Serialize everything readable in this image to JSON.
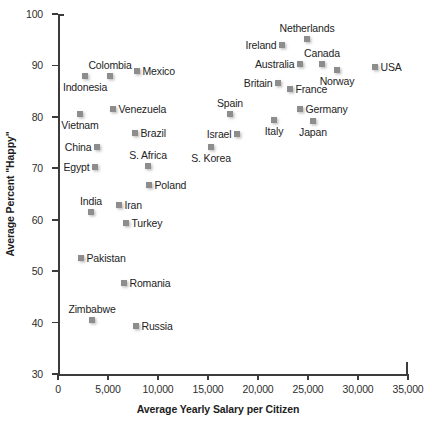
{
  "chart_data": {
    "type": "scatter",
    "title": "",
    "xlabel": "Average Yearly Salary per Citizen",
    "ylabel": "Average Percent \"Happy\"",
    "xlim": [
      0,
      35000
    ],
    "ylim": [
      30,
      100
    ],
    "xticks": [
      0,
      5000,
      10000,
      15000,
      20000,
      25000,
      30000,
      35000
    ],
    "xticklabels": [
      "0",
      "5,000",
      "10,000",
      "15,000",
      "20,000",
      "25,000",
      "30,000",
      "35,000"
    ],
    "yticks": [
      30,
      40,
      50,
      60,
      70,
      80,
      90,
      100
    ],
    "yticklabels": [
      "30",
      "40",
      "50",
      "60",
      "70",
      "80",
      "90",
      "100"
    ],
    "grid": false,
    "legend": null,
    "marker_color": "#8d8d8d",
    "marker_shape": "square",
    "points": [
      {
        "label": "Netherlands",
        "x": 24900,
        "y": 95.2,
        "label_pos": "above"
      },
      {
        "label": "Ireland",
        "x": 22400,
        "y": 94.0,
        "label_pos": "left"
      },
      {
        "label": "Canada",
        "x": 26400,
        "y": 90.2,
        "label_pos": "above"
      },
      {
        "label": "Australia",
        "x": 24200,
        "y": 90.2,
        "label_pos": "left"
      },
      {
        "label": "USA",
        "x": 31700,
        "y": 89.6,
        "label_pos": "right"
      },
      {
        "label": "Norway",
        "x": 27900,
        "y": 89.2,
        "label_pos": "below"
      },
      {
        "label": "Britain",
        "x": 22000,
        "y": 86.6,
        "label_pos": "left"
      },
      {
        "label": "France",
        "x": 23200,
        "y": 85.4,
        "label_pos": "right"
      },
      {
        "label": "Mexico",
        "x": 7900,
        "y": 88.9,
        "label_pos": "right"
      },
      {
        "label": "Colombia",
        "x": 5200,
        "y": 88.0,
        "label_pos": "above"
      },
      {
        "label": "Indonesia",
        "x": 2700,
        "y": 88.0,
        "label_pos": "below"
      },
      {
        "label": "Germany",
        "x": 24200,
        "y": 81.5,
        "label_pos": "right"
      },
      {
        "label": "Venezuela",
        "x": 5500,
        "y": 81.6,
        "label_pos": "right"
      },
      {
        "label": "Spain",
        "x": 17200,
        "y": 80.5,
        "label_pos": "above"
      },
      {
        "label": "Vietnam",
        "x": 2200,
        "y": 80.5,
        "label_pos": "below"
      },
      {
        "label": "Italy",
        "x": 21600,
        "y": 79.4,
        "label_pos": "below"
      },
      {
        "label": "Japan",
        "x": 25500,
        "y": 79.2,
        "label_pos": "below"
      },
      {
        "label": "Brazil",
        "x": 7700,
        "y": 76.9,
        "label_pos": "right"
      },
      {
        "label": "Israel",
        "x": 17900,
        "y": 76.7,
        "label_pos": "left"
      },
      {
        "label": "China",
        "x": 3900,
        "y": 74.2,
        "label_pos": "left"
      },
      {
        "label": "S. Korea",
        "x": 15300,
        "y": 74.2,
        "label_pos": "below"
      },
      {
        "label": "S. Africa",
        "x": 9000,
        "y": 70.5,
        "label_pos": "above"
      },
      {
        "label": "Egypt",
        "x": 3700,
        "y": 70.3,
        "label_pos": "left"
      },
      {
        "label": "Poland",
        "x": 9100,
        "y": 66.7,
        "label_pos": "right"
      },
      {
        "label": "Iran",
        "x": 6100,
        "y": 62.8,
        "label_pos": "right"
      },
      {
        "label": "India",
        "x": 3300,
        "y": 61.5,
        "label_pos": "above"
      },
      {
        "label": "Turkey",
        "x": 6800,
        "y": 59.3,
        "label_pos": "right"
      },
      {
        "label": "Pakistan",
        "x": 2300,
        "y": 52.6,
        "label_pos": "right"
      },
      {
        "label": "Romania",
        "x": 6600,
        "y": 47.7,
        "label_pos": "right"
      },
      {
        "label": "Zimbabwe",
        "x": 3400,
        "y": 40.5,
        "label_pos": "above"
      },
      {
        "label": "Russia",
        "x": 7800,
        "y": 39.3,
        "label_pos": "right"
      }
    ]
  }
}
